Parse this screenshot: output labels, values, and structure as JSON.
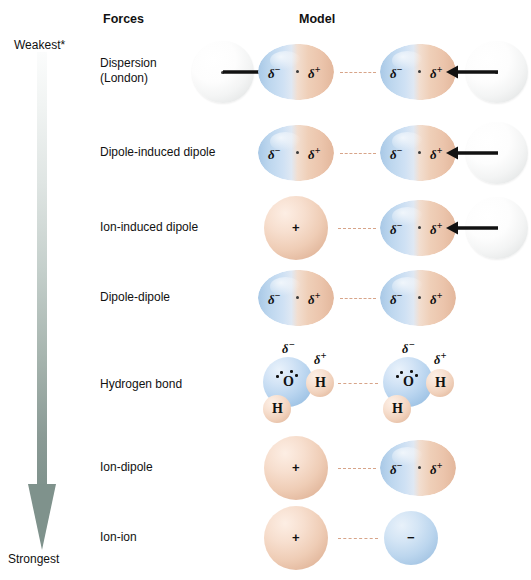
{
  "figure": {
    "headers": {
      "forces": "Forces",
      "model": "Model"
    },
    "strength_axis": {
      "top_label": "Weakest*",
      "bottom_label": "Strongest",
      "direction": "top-to-bottom",
      "gradient_top_color": "#f2f4f3",
      "gradient_bottom_color": "#7f928c"
    },
    "symbols": {
      "delta_negative": "δ",
      "delta_negative_sup": "−",
      "delta_positive": "δ",
      "delta_positive_sup": "+",
      "cation": "+",
      "anion": "−",
      "oxygen": "O",
      "hydrogen": "H"
    },
    "colors": {
      "dipole_negative_end": "#a8c8e6",
      "dipole_positive_end": "#e3b79c",
      "cation": "#efcdb6",
      "anion": "#bcd6ee",
      "nonpolar_atom": "#f3f4f4",
      "dashed_bond": "#d7a489",
      "arrow_black": "#111111"
    },
    "rows": [
      {
        "label": "Dispersion\n(London)",
        "name": "dispersion-london",
        "particles": [
          "nonpolar-atom",
          "dipole",
          "dipole",
          "nonpolar-atom"
        ],
        "has_induction_arrows": true
      },
      {
        "label": "Dipole-induced dipole",
        "name": "dipole-induced-dipole",
        "particles": [
          "dipole",
          "dipole",
          "nonpolar-atom"
        ],
        "has_induction_arrows": true
      },
      {
        "label": "Ion-induced dipole",
        "name": "ion-induced-dipole",
        "particles": [
          "cation",
          "dipole",
          "nonpolar-atom"
        ],
        "has_induction_arrows": true
      },
      {
        "label": "Dipole-dipole",
        "name": "dipole-dipole",
        "particles": [
          "dipole",
          "dipole"
        ],
        "has_induction_arrows": false
      },
      {
        "label": "Hydrogen bond",
        "name": "hydrogen-bond",
        "particles": [
          "water-molecule",
          "water-molecule"
        ],
        "has_induction_arrows": false
      },
      {
        "label": "Ion-dipole",
        "name": "ion-dipole",
        "particles": [
          "cation",
          "dipole"
        ],
        "has_induction_arrows": false
      },
      {
        "label": "Ion-ion",
        "name": "ion-ion",
        "particles": [
          "cation",
          "anion"
        ],
        "has_induction_arrows": false
      }
    ]
  }
}
